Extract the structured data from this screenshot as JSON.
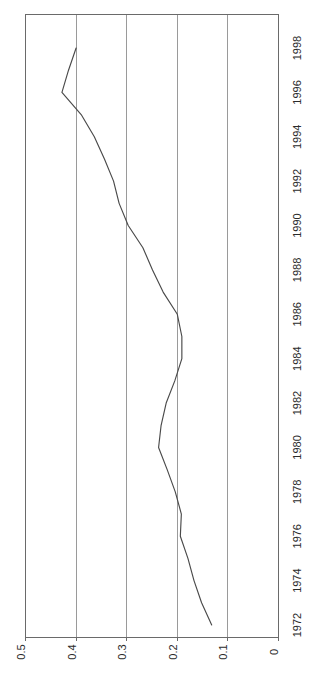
{
  "chart_data": {
    "type": "line",
    "title": "",
    "subtitle": "",
    "xlabel": "",
    "ylabel": "",
    "orientation": "rotated-90",
    "grid": true,
    "legend": null,
    "legend_position": "none",
    "value_axis": {
      "name": "value",
      "ticks": [
        "0.5",
        "0.4",
        "0.3",
        "0.2",
        "0.1",
        "0"
      ],
      "tick_values": [
        0.5,
        0.4,
        0.3,
        0.2,
        0.1,
        0
      ],
      "lim": [
        0.5,
        0
      ],
      "direction": "right-to-left"
    },
    "year_axis": {
      "name": "year",
      "ticks": [
        "1998",
        "1996",
        "1994",
        "1992",
        "1990",
        "1988",
        "1986",
        "1984",
        "1982",
        "1980",
        "1978",
        "1976",
        "1974",
        "1972"
      ],
      "tick_values": [
        1998,
        1996,
        1994,
        1992,
        1990,
        1988,
        1986,
        1984,
        1982,
        1980,
        1978,
        1976,
        1974,
        1972
      ],
      "lim": [
        1998,
        1972
      ],
      "direction": "top-to-bottom"
    },
    "x": [
      1972,
      1973,
      1974,
      1975,
      1976,
      1977,
      1978,
      1979,
      1980,
      1981,
      1982,
      1983,
      1984,
      1985,
      1986,
      1987,
      1988,
      1989,
      1990,
      1991,
      1992,
      1993,
      1994,
      1995,
      1996,
      1997,
      1998
    ],
    "values": [
      0.131,
      0.151,
      0.166,
      0.178,
      0.193,
      0.191,
      0.203,
      0.219,
      0.236,
      0.231,
      0.221,
      0.204,
      0.19,
      0.19,
      0.199,
      0.227,
      0.248,
      0.267,
      0.296,
      0.314,
      0.325,
      0.343,
      0.363,
      0.389,
      0.427,
      0.414,
      0.399
    ],
    "series": [
      {
        "name": "series-1",
        "color": "#4a4a4a",
        "values": [
          0.131,
          0.151,
          0.166,
          0.178,
          0.193,
          0.191,
          0.203,
          0.219,
          0.236,
          0.231,
          0.221,
          0.204,
          0.19,
          0.19,
          0.199,
          0.227,
          0.248,
          0.267,
          0.296,
          0.314,
          0.325,
          0.343,
          0.363,
          0.389,
          0.427,
          0.414,
          0.399
        ]
      }
    ],
    "annotations": []
  },
  "geometry": {
    "plot_left": 25,
    "plot_right": 278,
    "plot_top": 14,
    "plot_bottom": 637,
    "value_at_left": 0.5,
    "value_at_right": 0.0,
    "year_at_top": 1998,
    "year_at_bottom": 1972,
    "year_tick_label_x": 298,
    "value_tick_label_y": 652
  },
  "style": {
    "background": "#ffffff",
    "line_color": "#4a4a4a",
    "grid_color": "#9a9a9a",
    "axis_color": "#6a6a6a",
    "label_color": "#2b2b2b"
  }
}
